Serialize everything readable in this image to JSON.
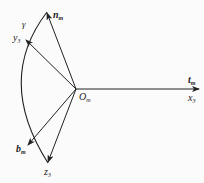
{
  "diagram": {
    "origin": {
      "label": "O",
      "sub": "m"
    },
    "vectors": [
      {
        "name": "n",
        "sub": "m",
        "bold": true
      },
      {
        "name": "y",
        "sub": "3",
        "bold": false
      },
      {
        "name": "t",
        "sub": "m",
        "bold": true
      },
      {
        "name": "x",
        "sub": "3",
        "bold": false
      },
      {
        "name": "b",
        "sub": "m",
        "bold": true
      },
      {
        "name": "z",
        "sub": "3",
        "bold": false
      }
    ],
    "angle_label": "γ",
    "colors": {
      "line": "#222222",
      "background": "#fbfbfb"
    }
  }
}
